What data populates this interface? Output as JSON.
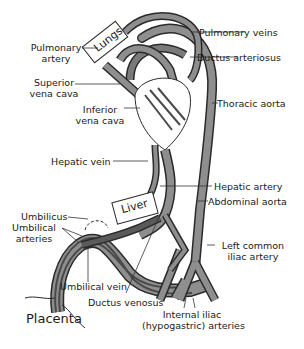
{
  "diagram": {
    "type": "fetal-circulation",
    "colors": {
      "vessel_fill": "#8e8e8e",
      "vessel_dark": "#5a5a5a",
      "vessel_outline": "#2a2a2a",
      "leader_line": "#333333",
      "background": "#ffffff"
    },
    "organs": {
      "lungs": "Lungs",
      "liver": "Liver",
      "placenta": "Placenta"
    },
    "labels": {
      "pulmonary_artery_1": "Pulmonary",
      "pulmonary_artery_2": "artery",
      "superior_vena_cava_1": "Superior",
      "superior_vena_cava_2": "vena cava",
      "inferior_vena_cava_1": "Inferior",
      "inferior_vena_cava_2": "vena cava",
      "pulmonary_veins": "Pulmonary veins",
      "ductus_arteriosus": "Ductus arteriosus",
      "thoracic_aorta": "Thoracic aorta",
      "hepatic_vein": "Hepatic vein",
      "hepatic_artery": "Hepatic artery",
      "abdominal_aorta": "Abdominal aorta",
      "umbilicus": "Umbilicus",
      "umbilical_arteries_1": "Umbilical",
      "umbilical_arteries_2": "arteries",
      "left_common_iliac_1": "Left common",
      "left_common_iliac_2": "iliac artery",
      "umbilical_vein": "Umbilical vein",
      "ductus_venosus": "Ductus venosus",
      "internal_iliac_1": "Internal iliac",
      "internal_iliac_2": "(hypogastric) arteries"
    }
  }
}
